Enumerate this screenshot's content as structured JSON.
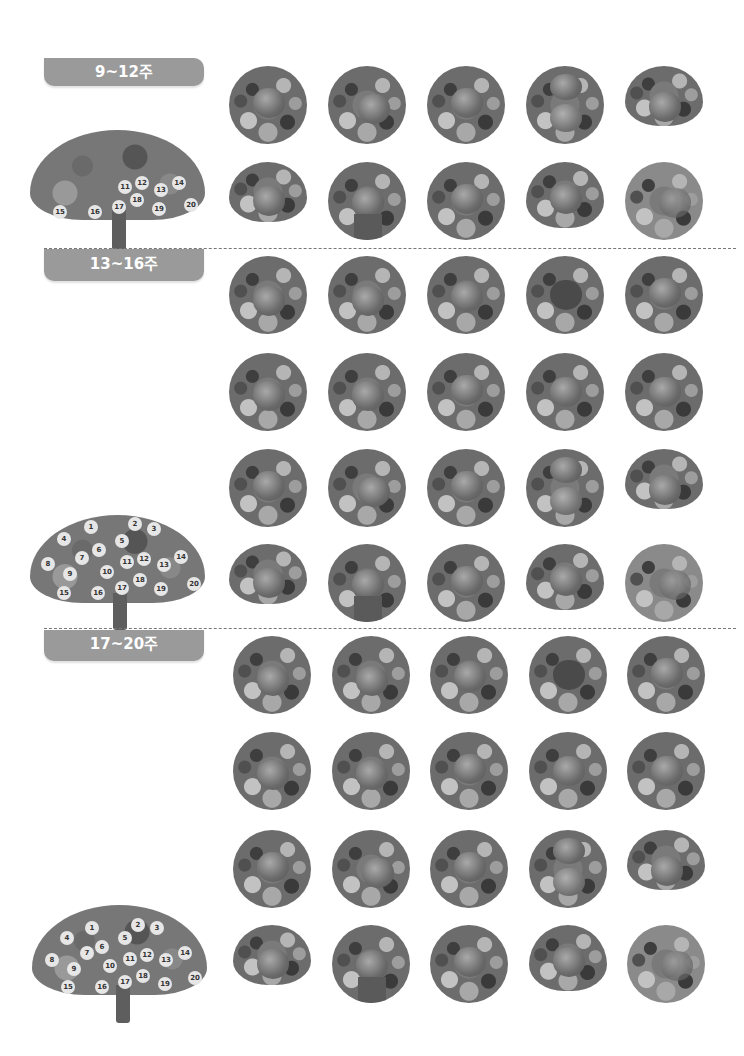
{
  "sections": [
    {
      "label": "9~12주",
      "tree_numbers": [
        "11",
        "12",
        "13",
        "14",
        "15",
        "16",
        "17",
        "18",
        "19",
        "20"
      ],
      "photo_count": 10
    },
    {
      "label": "13~16주",
      "tree_numbers": [
        "1",
        "2",
        "3",
        "4",
        "5",
        "6",
        "7",
        "8",
        "9",
        "10",
        "11",
        "12",
        "13",
        "14",
        "15",
        "16",
        "17",
        "18",
        "19",
        "20"
      ],
      "photo_count": 20
    },
    {
      "label": "17~20주",
      "tree_numbers": [
        "1",
        "2",
        "3",
        "4",
        "5",
        "6",
        "7",
        "8",
        "9",
        "10",
        "11",
        "12",
        "13",
        "14",
        "15",
        "16",
        "17",
        "18",
        "19",
        "20"
      ],
      "photo_count": 20
    }
  ],
  "colors": {
    "label_bg": "#9a9a9a",
    "label_text": "#ffffff",
    "divider": "#777777"
  }
}
